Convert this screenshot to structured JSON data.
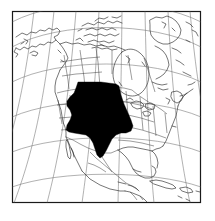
{
  "figure": {
    "kind": "locator-map",
    "title": "North America locator map",
    "width_px": 215,
    "height_px": 221,
    "background_color": "#ffffff",
    "frame": {
      "label": "map-frame",
      "x": 12,
      "y": 11,
      "width": 189,
      "height": 192,
      "stroke_color": "#1a1a1a",
      "fill_color": "#ffffff"
    }
  },
  "map": {
    "projection": "conic",
    "region_depicted": "North America",
    "coastline_color": "#2b2b2b",
    "border_color": "#3a3a3a",
    "graticule": {
      "visible": true,
      "color": "#6f6f6f",
      "meridian_count": 7,
      "parallel_count": 6,
      "description": "curved latitude and longitude lines converging toward the north"
    },
    "landmasses": [
      "Alaska",
      "Canada",
      "Canadian Arctic Archipelago",
      "Greenland",
      "Contiguous United States",
      "Mexico",
      "Baja California",
      "Central America",
      "Cuba",
      "Hispaniola",
      "Florida"
    ],
    "water_bodies": [
      "Pacific Ocean",
      "Atlantic Ocean",
      "Hudson Bay",
      "Gulf of Mexico",
      "Caribbean Sea",
      "Great Lakes"
    ]
  },
  "highlight": {
    "label": "highlighted-region",
    "fill_color": "#000000",
    "description": "solid black filled area over the central United States Great Plains extending south through Texas",
    "approx_bounds_px": {
      "left": 66,
      "top": 82,
      "right": 133,
      "bottom": 158
    }
  },
  "legend": {
    "visible": false,
    "items": []
  },
  "labels": {
    "visible": false,
    "items": []
  }
}
